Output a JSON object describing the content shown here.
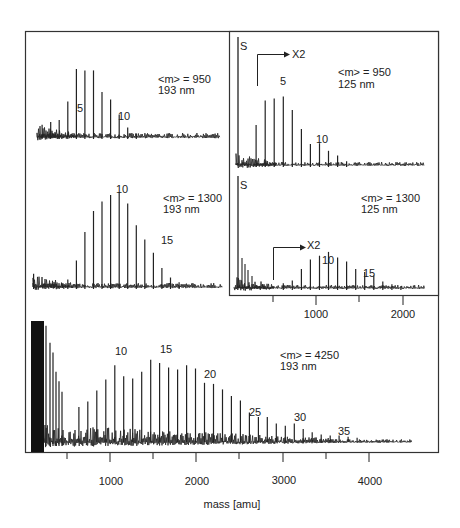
{
  "chart_data": {
    "type": "bar",
    "title": "",
    "xlabel": "mass [amu]",
    "ylabel": "",
    "unit_mass_amu": 104,
    "panels": [
      {
        "id": "m950-193",
        "annotation": [
          "<m> = 950",
          "193 nm"
        ],
        "peak_labels": [
          {
            "n": 5,
            "text": "5"
          },
          {
            "n": 10,
            "text": "10"
          }
        ],
        "peaks": [
          {
            "n": 2,
            "h": 0.18
          },
          {
            "n": 3,
            "h": 0.22
          },
          {
            "n": 4,
            "h": 0.25
          },
          {
            "n": 5,
            "h": 0.52
          },
          {
            "n": 6,
            "h": 1.0
          },
          {
            "n": 7,
            "h": 0.98
          },
          {
            "n": 8,
            "h": 0.98
          },
          {
            "n": 9,
            "h": 0.66
          },
          {
            "n": 10,
            "h": 0.55
          },
          {
            "n": 11,
            "h": 0.33
          },
          {
            "n": 12,
            "h": 0.14
          },
          {
            "n": 13,
            "h": 0.05
          }
        ],
        "xlim": [
          0,
          2300
        ]
      },
      {
        "id": "m1300-193",
        "annotation": [
          "<m> = 1300",
          "193 nm"
        ],
        "peak_labels": [
          {
            "n": 10,
            "text": "10"
          },
          {
            "n": 15,
            "text": "15"
          }
        ],
        "peaks": [
          {
            "n": 1,
            "h": 0.14
          },
          {
            "n": 5,
            "h": 0.08
          },
          {
            "n": 6,
            "h": 0.28
          },
          {
            "n": 7,
            "h": 0.58
          },
          {
            "n": 8,
            "h": 0.8
          },
          {
            "n": 9,
            "h": 0.9
          },
          {
            "n": 10,
            "h": 0.97
          },
          {
            "n": 11,
            "h": 1.0
          },
          {
            "n": 12,
            "h": 0.88
          },
          {
            "n": 13,
            "h": 0.65
          },
          {
            "n": 14,
            "h": 0.5
          },
          {
            "n": 15,
            "h": 0.36
          },
          {
            "n": 16,
            "h": 0.2
          },
          {
            "n": 17,
            "h": 0.1
          },
          {
            "n": 18,
            "h": 0.05
          }
        ],
        "xlim": [
          0,
          2300
        ]
      },
      {
        "id": "m950-125",
        "annotation": [
          "<m> = 950",
          "125 nm"
        ],
        "marker_S": "S",
        "scale_marker": "X2",
        "peak_labels": [
          {
            "n": 5,
            "text": "5"
          },
          {
            "n": 10,
            "text": "10"
          }
        ],
        "peaks": [
          {
            "n": 3,
            "h": 0.42
          },
          {
            "n": 4,
            "h": 0.68
          },
          {
            "n": 5,
            "h": 0.7
          },
          {
            "n": 6,
            "h": 0.72
          },
          {
            "n": 7,
            "h": 0.58
          },
          {
            "n": 8,
            "h": 0.38
          },
          {
            "n": 9,
            "h": 0.22
          },
          {
            "n": 10,
            "h": 0.23
          },
          {
            "n": 11,
            "h": 0.15
          },
          {
            "n": 12,
            "h": 0.1
          },
          {
            "n": 13,
            "h": 0.04
          }
        ],
        "xlim": [
          0,
          2300
        ]
      },
      {
        "id": "m1300-125",
        "annotation": [
          "<m> = 1300",
          "125 nm"
        ],
        "marker_S": "S",
        "scale_marker": "X2",
        "peak_labels": [
          {
            "n": 10,
            "text": "10"
          },
          {
            "n": 15,
            "text": "15"
          }
        ],
        "peaks": [
          {
            "n": 6,
            "h": 0.05
          },
          {
            "n": 7,
            "h": 0.08
          },
          {
            "n": 8,
            "h": 0.2
          },
          {
            "n": 9,
            "h": 0.3
          },
          {
            "n": 10,
            "h": 0.34
          },
          {
            "n": 11,
            "h": 0.38
          },
          {
            "n": 12,
            "h": 0.32
          },
          {
            "n": 13,
            "h": 0.28
          },
          {
            "n": 14,
            "h": 0.2
          },
          {
            "n": 15,
            "h": 0.17
          },
          {
            "n": 16,
            "h": 0.13
          },
          {
            "n": 17,
            "h": 0.07
          },
          {
            "n": 18,
            "h": 0.04
          },
          {
            "n": 19,
            "h": 0.02
          }
        ],
        "xlim": [
          0,
          2300
        ],
        "x_ticks": [
          500,
          1000,
          1500,
          2000
        ],
        "x_tick_labels": [
          "1000",
          "2000"
        ]
      },
      {
        "id": "m4250-193",
        "annotation": [
          "<m> = 4250",
          "193 nm"
        ],
        "peak_labels": [
          {
            "n": 10,
            "text": "10"
          },
          {
            "n": 15,
            "text": "15"
          },
          {
            "n": 20,
            "text": "20"
          },
          {
            "n": 25,
            "text": "25"
          },
          {
            "n": 30,
            "text": "30"
          },
          {
            "n": 35,
            "text": "35"
          }
        ],
        "peaks": [
          {
            "n": 6,
            "h": 0.3
          },
          {
            "n": 7,
            "h": 0.35
          },
          {
            "n": 8,
            "h": 0.45
          },
          {
            "n": 9,
            "h": 0.55
          },
          {
            "n": 10,
            "h": 0.68
          },
          {
            "n": 11,
            "h": 0.58
          },
          {
            "n": 12,
            "h": 0.56
          },
          {
            "n": 13,
            "h": 0.62
          },
          {
            "n": 14,
            "h": 0.73
          },
          {
            "n": 15,
            "h": 0.7
          },
          {
            "n": 16,
            "h": 0.66
          },
          {
            "n": 17,
            "h": 0.64
          },
          {
            "n": 18,
            "h": 0.68
          },
          {
            "n": 19,
            "h": 0.65
          },
          {
            "n": 20,
            "h": 0.52
          },
          {
            "n": 21,
            "h": 0.51
          },
          {
            "n": 22,
            "h": 0.46
          },
          {
            "n": 23,
            "h": 0.4
          },
          {
            "n": 24,
            "h": 0.36
          },
          {
            "n": 25,
            "h": 0.25
          },
          {
            "n": 26,
            "h": 0.21
          },
          {
            "n": 27,
            "h": 0.21
          },
          {
            "n": 28,
            "h": 0.15
          },
          {
            "n": 29,
            "h": 0.13
          },
          {
            "n": 30,
            "h": 0.15
          },
          {
            "n": 31,
            "h": 0.1
          },
          {
            "n": 32,
            "h": 0.07
          },
          {
            "n": 33,
            "h": 0.05
          },
          {
            "n": 34,
            "h": 0.04
          },
          {
            "n": 35,
            "h": 0.04
          },
          {
            "n": 36,
            "h": 0.03
          },
          {
            "n": 37,
            "h": 0.02
          }
        ],
        "xlim": [
          0,
          4600
        ],
        "x_ticks": [
          500,
          1000,
          1500,
          2000,
          2500,
          3000,
          3500,
          4000
        ],
        "x_tick_labels": [
          "1000",
          "2000",
          "3000",
          "4000"
        ]
      }
    ]
  },
  "labels": {
    "p1_line1": "<m> = 950",
    "p1_line2": "193 nm",
    "p1_peak_a": "5",
    "p1_peak_b": "10",
    "p2_line1": "<m> = 1300",
    "p2_line2": "193 nm",
    "p2_peak_a": "10",
    "p2_peak_b": "15",
    "p3_line1": "<m> = 950",
    "p3_line2": "125 nm",
    "p3_S": "S",
    "p3_x2": "X2",
    "p3_peak_a": "5",
    "p3_peak_b": "10",
    "p4_line1": "<m> = 1300",
    "p4_line2": "125 nm",
    "p4_S": "S",
    "p4_x2": "X2",
    "p4_peak_a": "10",
    "p4_peak_b": "15",
    "p4_tick_1000": "1000",
    "p4_tick_2000": "2000",
    "p5_line1": "<m> = 4250",
    "p5_line2": "193 nm",
    "p5_peak_10": "10",
    "p5_peak_15": "15",
    "p5_peak_20": "20",
    "p5_peak_25": "25",
    "p5_peak_30": "30",
    "p5_peak_35": "35",
    "tick_1000": "1000",
    "tick_2000": "2000",
    "tick_3000": "3000",
    "tick_4000": "4000",
    "xlabel": "mass [amu]"
  }
}
